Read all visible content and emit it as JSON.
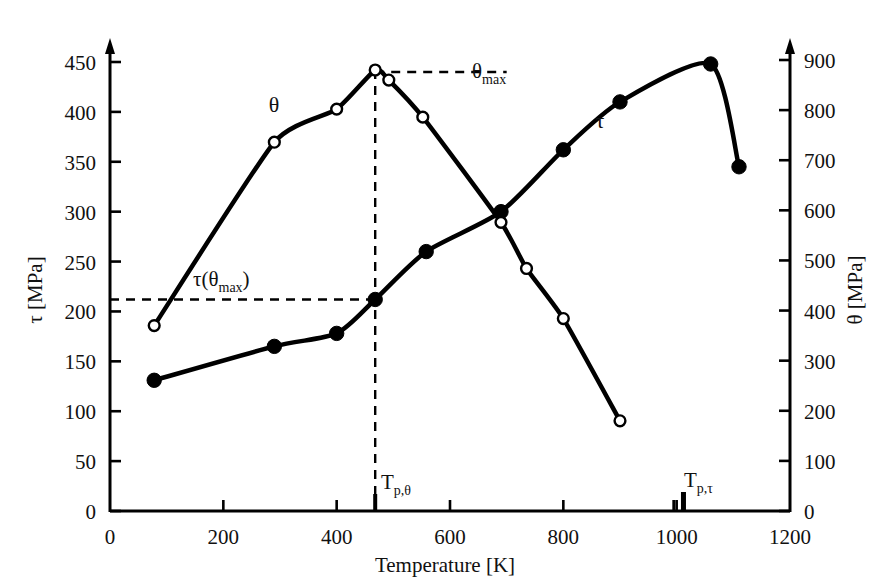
{
  "chart_data": {
    "type": "line",
    "title": "",
    "xlabel": "Temperature  [K]",
    "ylabel_left": "τ [MPa]",
    "ylabel_right": "θ [MPa]",
    "xlim": [
      0,
      1200
    ],
    "ylim_left": [
      0,
      450
    ],
    "ylim_right": [
      0,
      900
    ],
    "xticks": [
      0,
      200,
      400,
      600,
      800,
      1000,
      1200
    ],
    "xtick_labels": [
      "0",
      "200",
      "400",
      "600",
      "800",
      "1000",
      "1200"
    ],
    "yticks_left": [
      0,
      50,
      100,
      150,
      200,
      250,
      300,
      350,
      400,
      450
    ],
    "ytick_labels_left": [
      "0",
      "50",
      "100",
      "150",
      "200",
      "250",
      "300",
      "350",
      "400",
      "450"
    ],
    "yticks_right": [
      0,
      100,
      200,
      300,
      400,
      500,
      600,
      700,
      800,
      900
    ],
    "ytick_labels_right": [
      "0",
      "100",
      "200",
      "300",
      "400",
      "500",
      "600",
      "700",
      "800",
      "900"
    ],
    "grid": false,
    "legend": "in-plot curve labels",
    "series": [
      {
        "name": "τ",
        "label": "τ",
        "axis": "left",
        "marker": "filled-circle",
        "color": "#000000",
        "points": [
          {
            "x": 78,
            "y": 131
          },
          {
            "x": 290,
            "y": 165
          },
          {
            "x": 400,
            "y": 178
          },
          {
            "x": 468,
            "y": 212
          },
          {
            "x": 558,
            "y": 260
          },
          {
            "x": 690,
            "y": 300
          },
          {
            "x": 800,
            "y": 362
          },
          {
            "x": 900,
            "y": 410
          },
          {
            "x": 1060,
            "y": 448
          },
          {
            "x": 1110,
            "y": 345
          }
        ]
      },
      {
        "name": "θ",
        "label": "θ",
        "axis": "right",
        "marker": "open-circle",
        "color": "#000000",
        "points_left_scale": [
          {
            "x": 78,
            "y": 185
          },
          {
            "x": 290,
            "y": 368
          },
          {
            "x": 400,
            "y": 401
          },
          {
            "x": 468,
            "y": 440
          },
          {
            "x": 492,
            "y": 430
          },
          {
            "x": 552,
            "y": 393
          },
          {
            "x": 690,
            "y": 288
          },
          {
            "x": 735,
            "y": 242
          },
          {
            "x": 800,
            "y": 192
          },
          {
            "x": 900,
            "y": 90
          }
        ],
        "points_right_scale": [
          {
            "x": 78,
            "y": 370
          },
          {
            "x": 290,
            "y": 736
          },
          {
            "x": 400,
            "y": 802
          },
          {
            "x": 468,
            "y": 880
          },
          {
            "x": 492,
            "y": 860
          },
          {
            "x": 552,
            "y": 786
          },
          {
            "x": 690,
            "y": 576
          },
          {
            "x": 735,
            "y": 484
          },
          {
            "x": 800,
            "y": 384
          },
          {
            "x": 900,
            "y": 180
          }
        ]
      }
    ],
    "annotations": [
      {
        "name": "theta-max",
        "text": "θmax",
        "base": "θ",
        "sub": "max",
        "x": 700,
        "y_left": 440
      },
      {
        "name": "tau-theta-max",
        "text": "τ(θmax)",
        "base": "τ(θ",
        "sub": "max",
        "tail": ")",
        "x": 300,
        "y_left": 228
      },
      {
        "name": "Tp-theta-marker",
        "text": "Tp,θ",
        "base": "T",
        "sub": "p,θ",
        "x": 468
      },
      {
        "name": "Tp-tau-marker",
        "text": "Tp,τ",
        "base": "T",
        "sub": "p,τ",
        "x": 1012,
        "secondary_x": 995
      }
    ],
    "guide_lines": [
      {
        "name": "theta-max-horizontal",
        "type": "dashed-horizontal",
        "y_left": 440,
        "from_x": 468,
        "to_x": 700
      },
      {
        "name": "theta-max-vertical",
        "type": "dashed-vertical",
        "x": 468,
        "from_y_left": 0,
        "to_y_left": 440
      },
      {
        "name": "tau-theta-max-horizontal",
        "type": "dashed-horizontal",
        "y_left": 212,
        "from_x": 0,
        "to_x": 468
      }
    ]
  },
  "axis": {
    "x_title": "Temperature  [K]",
    "y_left_title": "τ [MPa]",
    "y_right_title": "θ [MPa]"
  },
  "labels": {
    "theta_curve": "θ",
    "tau_curve": "τ",
    "theta_max_base": "θ",
    "theta_max_sub": "max",
    "tau_theta_max_open": "τ(θ",
    "tau_theta_max_sub": "max",
    "tau_theta_max_close": ")",
    "tp_theta_base": "T",
    "tp_theta_sub": "p,θ",
    "tp_tau_base": "T",
    "tp_tau_sub": "p,τ"
  },
  "colors": {
    "ink": "#000000",
    "background": "#ffffff"
  }
}
